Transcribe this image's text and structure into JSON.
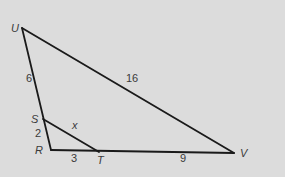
{
  "diagram": {
    "background": "#dcdcdc",
    "line_color": "#1a1a1a",
    "vertices": [
      {
        "name": "U",
        "x": 22,
        "y": 28,
        "label_x": 11,
        "label_y": 32
      },
      {
        "name": "S",
        "x": 43,
        "y": 119,
        "label_x": 31,
        "label_y": 123
      },
      {
        "name": "R",
        "x": 51,
        "y": 150,
        "label_x": 36,
        "label_y": 154
      },
      {
        "name": "T",
        "x": 99,
        "y": 152,
        "label_x": 98,
        "label_y": 164
      },
      {
        "name": "V",
        "x": 234,
        "y": 153,
        "label_x": 240,
        "label_y": 157
      }
    ],
    "segments": [
      {
        "from": "U",
        "to": "V",
        "length_label": "16"
      },
      {
        "from": "U",
        "to": "S",
        "length_label": "6"
      },
      {
        "from": "S",
        "to": "R",
        "length_label": "2"
      },
      {
        "from": "R",
        "to": "T",
        "length_label": "3"
      },
      {
        "from": "T",
        "to": "V",
        "length_label": "9"
      },
      {
        "from": "S",
        "to": "T",
        "length_label": "x"
      }
    ],
    "labels": {
      "U": "U",
      "S": "S",
      "R": "R",
      "T": "T",
      "V": "V",
      "UV": "16",
      "US": "6",
      "SR": "2",
      "RT": "3",
      "TV": "9",
      "ST": "x"
    }
  }
}
